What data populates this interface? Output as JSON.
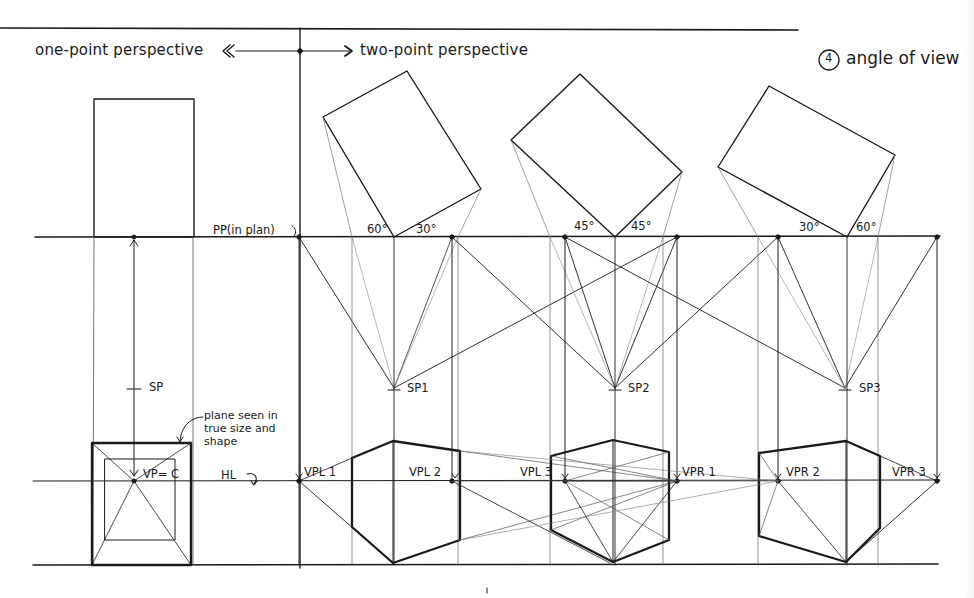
{
  "header": {
    "left_title": "one-point perspective",
    "right_title": "two-point perspective",
    "section_number": "4",
    "section_title": "angle of view"
  },
  "labels": {
    "picture_plane": "PP(in plan)",
    "horizon_line": "HL",
    "station_point": "SP",
    "vanishing_center": "VP= C",
    "note": "plane seen in true size and shape"
  },
  "views": [
    {
      "angle_left": "60°",
      "angle_right": "30°",
      "station_point": "SP1",
      "vp_left": "VPL 1",
      "vp_right": "VPR 1"
    },
    {
      "angle_left": "45°",
      "angle_right": "45°",
      "station_point": "SP2",
      "vp_left": "VPL 2",
      "vp_right": "VPR 2"
    },
    {
      "angle_left": "30°",
      "angle_right": "60°",
      "station_point": "SP3",
      "vp_left": "VPL 3",
      "vp_right": "VPR 3"
    }
  ],
  "colors": {
    "ink": "#1a1a1a",
    "light_ink": "#6b6b6b",
    "paper": "#ffffff"
  }
}
